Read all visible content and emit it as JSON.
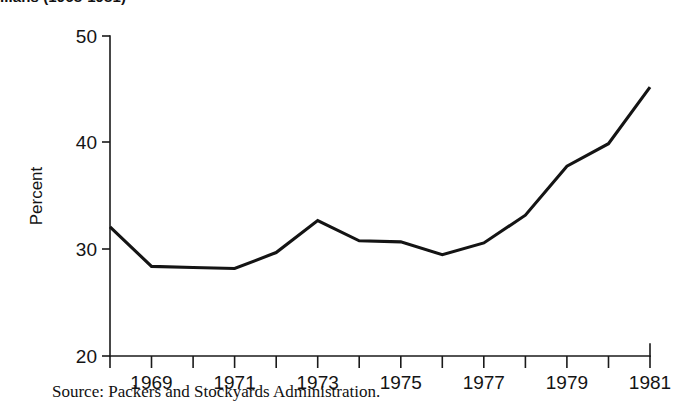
{
  "chart_data": {
    "type": "line",
    "title_visible_fragment": "...ans (1968-1981)",
    "xlabel": "",
    "ylabel": "Percent",
    "xlim": [
      1968,
      1981
    ],
    "ylim": [
      20,
      50
    ],
    "yticks": [
      20,
      30,
      40,
      50
    ],
    "ytick_labels": [
      "20",
      "30",
      "40",
      "50"
    ],
    "xticks": [
      1968,
      1969,
      1970,
      1971,
      1972,
      1973,
      1974,
      1975,
      1976,
      1977,
      1978,
      1979,
      1980,
      1981
    ],
    "xtick_labels": [
      "",
      "1969",
      "",
      "1971",
      "",
      "1973",
      "",
      "1975",
      "",
      "1977",
      "",
      "1979",
      "",
      "1981"
    ],
    "grid": false,
    "legend": false,
    "line_color": "#141414",
    "x": [
      1968,
      1969,
      1970,
      1971,
      1972,
      1973,
      1974,
      1975,
      1976,
      1977,
      1978,
      1979,
      1980,
      1981
    ],
    "values": [
      32.1,
      28.4,
      28.3,
      28.2,
      29.7,
      32.7,
      30.8,
      30.7,
      29.5,
      30.6,
      33.2,
      37.8,
      39.9,
      45.2
    ],
    "series": [
      {
        "name": "Four-firm concentration",
        "values": [
          32.1,
          28.4,
          28.3,
          28.2,
          29.7,
          32.7,
          30.8,
          30.7,
          29.5,
          30.6,
          33.2,
          37.8,
          39.9,
          45.2
        ]
      }
    ]
  },
  "source": {
    "text": "Source: Packers and Stockyards Administration."
  },
  "axis": {
    "y_label": "Percent",
    "y_tick_50": "50",
    "y_tick_40": "40",
    "y_tick_30": "30",
    "y_tick_20": "20",
    "x_tick_1969": "1969",
    "x_tick_1971": "1971",
    "x_tick_1973": "1973",
    "x_tick_1975": "1975",
    "x_tick_1977": "1977",
    "x_tick_1979": "1979",
    "x_tick_1981": "1981"
  },
  "colors": {
    "background": "#ffffff",
    "ink": "#141414",
    "line": "#141414"
  }
}
